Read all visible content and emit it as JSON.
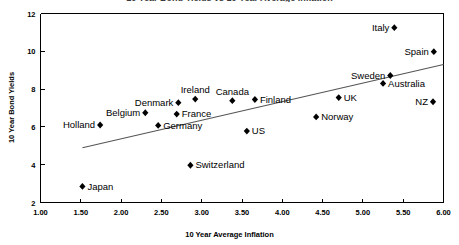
{
  "chart_data": {
    "type": "scatter",
    "title": "10 Year Bond Yields vs 10 Year Average Inflation",
    "xlabel": "10 Year Average Inflation",
    "ylabel": "10 Year Bond Yields",
    "xlim": [
      1.0,
      6.0
    ],
    "ylim": [
      2,
      12
    ],
    "xticks": [
      "1.00",
      "1.50",
      "2.00",
      "2.50",
      "3.00",
      "3.50",
      "4.00",
      "4.50",
      "5.00",
      "5.50",
      "6.00"
    ],
    "yticks": [
      "2",
      "4",
      "6",
      "8",
      "10",
      "12"
    ],
    "grid": false,
    "legend": "none",
    "marker": "diamond",
    "marker_color": "#000000",
    "trendline": {
      "visible": true,
      "color": "#555555",
      "x_start": 1.52,
      "y_start": 4.9,
      "x_end": 6.0,
      "y_end": 9.3
    },
    "points": [
      {
        "label": "Japan",
        "x": 1.52,
        "y": 2.85,
        "label_pos": "right"
      },
      {
        "label": "Holland",
        "x": 1.74,
        "y": 6.1,
        "label_pos": "left"
      },
      {
        "label": "Belgium",
        "x": 2.3,
        "y": 6.75,
        "label_pos": "left"
      },
      {
        "label": "Germany",
        "x": 2.46,
        "y": 6.08,
        "label_pos": "right"
      },
      {
        "label": "Denmark",
        "x": 2.71,
        "y": 7.28,
        "label_pos": "left"
      },
      {
        "label": "France",
        "x": 2.69,
        "y": 6.68,
        "label_pos": "right"
      },
      {
        "label": "Switzerland",
        "x": 2.86,
        "y": 3.97,
        "label_pos": "right"
      },
      {
        "label": "Ireland",
        "x": 2.92,
        "y": 7.47,
        "label_pos": "above"
      },
      {
        "label": "Canada",
        "x": 3.38,
        "y": 7.39,
        "label_pos": "above"
      },
      {
        "label": "US",
        "x": 3.56,
        "y": 5.78,
        "label_pos": "right"
      },
      {
        "label": "Finland",
        "x": 3.66,
        "y": 7.45,
        "label_pos": "right"
      },
      {
        "label": "Norway",
        "x": 4.42,
        "y": 6.53,
        "label_pos": "right"
      },
      {
        "label": "UK",
        "x": 4.7,
        "y": 7.55,
        "label_pos": "right"
      },
      {
        "label": "Australia",
        "x": 5.25,
        "y": 8.3,
        "label_pos": "right"
      },
      {
        "label": "Sweden",
        "x": 5.34,
        "y": 8.72,
        "label_pos": "left"
      },
      {
        "label": "Italy",
        "x": 5.39,
        "y": 11.25,
        "label_pos": "left"
      },
      {
        "label": "NZ",
        "x": 5.87,
        "y": 7.33,
        "label_pos": "left"
      },
      {
        "label": "Spain",
        "x": 5.88,
        "y": 9.98,
        "label_pos": "left"
      }
    ]
  }
}
